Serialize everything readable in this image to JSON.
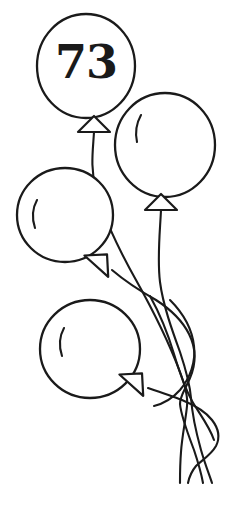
{
  "artwork": {
    "title": "Hand-drawn balloon bunch",
    "style": "line-art-outline",
    "canvas": {
      "width": 227,
      "height": 506
    },
    "colors": {
      "ink": "#1a1a1a",
      "background": "#ffffff",
      "balloon_fill": "#ffffff"
    },
    "number_label": {
      "text": "73",
      "on_balloon": "balloon-1",
      "x": 86,
      "y": 62
    },
    "balloons": [
      {
        "id": "balloon-1",
        "name": "top-balloon-numbered",
        "cx": 86,
        "cy": 66,
        "rx": 49,
        "ry": 52,
        "label": "73",
        "has_highlight": false,
        "knot": {
          "cx": 94,
          "cy": 125,
          "rotation": 0
        }
      },
      {
        "id": "balloon-2",
        "name": "right-balloon",
        "cx": 165,
        "cy": 145,
        "rx": 50,
        "ry": 52,
        "label": "",
        "has_highlight": true,
        "knot": {
          "cx": 161,
          "cy": 203,
          "rotation": 0
        }
      },
      {
        "id": "balloon-3",
        "name": "left-middle-balloon",
        "cx": 65,
        "cy": 215,
        "rx": 48,
        "ry": 47,
        "label": "",
        "has_highlight": true,
        "knot": {
          "cx": 101,
          "cy": 261,
          "rotation": 42
        }
      },
      {
        "id": "balloon-4",
        "name": "bottom-balloon",
        "cx": 90,
        "cy": 349,
        "rx": 50,
        "ry": 49,
        "label": "",
        "has_highlight": true,
        "knot": {
          "cx": 136,
          "cy": 380,
          "rotation": 42
        }
      }
    ],
    "strings": {
      "count": 4,
      "converge_point": {
        "x": 186,
        "y": 400
      },
      "tail_end_y": 484
    }
  }
}
